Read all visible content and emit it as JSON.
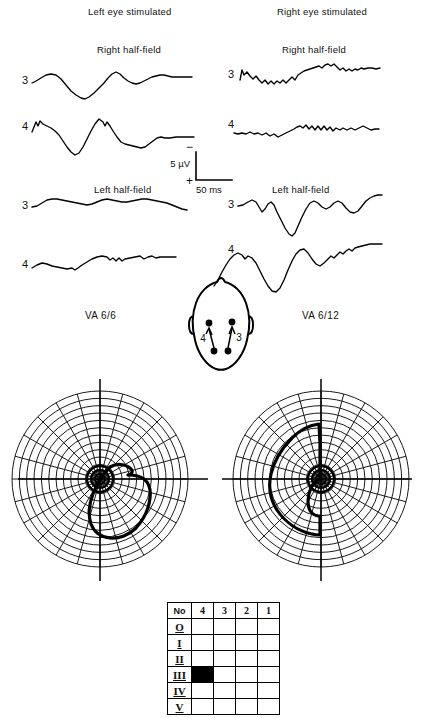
{
  "figure": {
    "type": "half-field-VEP-and-visual-fields",
    "columns": [
      {
        "id": "left-eye",
        "title": "Left eye stimulated",
        "va_label": "VA 6/6"
      },
      {
        "id": "right-eye",
        "title": "Right eye stimulated",
        "va_label": "VA 6/12"
      }
    ],
    "section_titles": {
      "right_half_field": "Right half-field",
      "left_half_field": "Left half-field"
    },
    "channel_labels": {
      "ch3": "3",
      "ch4": "4"
    },
    "scale": {
      "amplitude": "5 µV",
      "time": "50 ms",
      "polarity_top": "−",
      "polarity_bottom": "+"
    },
    "head_diagram": {
      "electrode_labels": [
        "4",
        "3"
      ],
      "electrode_count": 4,
      "view": "top-of-head"
    },
    "legend_table": {
      "header": [
        "No",
        "4",
        "3",
        "2",
        "1"
      ],
      "rows": [
        "O",
        "I",
        "II",
        "III",
        "IV",
        "V"
      ],
      "filled_cell": {
        "row": "III",
        "column": "4"
      }
    }
  },
  "chart_data": [
    {
      "type": "line",
      "id": "left-eye-right-half-field-ch3",
      "title": "Left eye stimulated — Right half-field — channel 3",
      "xlabel": "time (ms)",
      "ylabel": "amplitude (µV)",
      "xlim": [
        0,
        250
      ],
      "ylim": [
        -8,
        8
      ],
      "grid": false,
      "x": [
        0,
        8,
        16,
        24,
        32,
        40,
        48,
        56,
        64,
        72,
        80,
        88,
        96,
        104,
        112,
        120,
        128,
        136,
        144,
        152,
        160,
        168,
        176,
        184,
        192,
        200,
        208,
        216,
        224,
        232,
        240,
        250
      ],
      "values": [
        0.0,
        0.6,
        2.0,
        2.6,
        2.4,
        1.4,
        -0.6,
        -2.6,
        -4.2,
        -4.6,
        -3.4,
        -1.6,
        0.4,
        2.0,
        3.4,
        4.6,
        4.2,
        2.8,
        1.6,
        1.2,
        1.4,
        2.2,
        3.0,
        3.4,
        3.2,
        2.8,
        3.0,
        3.1,
        3.0,
        3.0,
        3.0,
        3.0
      ]
    },
    {
      "type": "line",
      "id": "left-eye-right-half-field-ch4",
      "title": "Left eye stimulated — Right half-field — channel 4",
      "xlabel": "time (ms)",
      "ylabel": "amplitude (µV)",
      "xlim": [
        0,
        250
      ],
      "ylim": [
        -8,
        8
      ],
      "grid": false,
      "x": [
        0,
        8,
        16,
        24,
        32,
        40,
        48,
        56,
        64,
        72,
        80,
        88,
        96,
        104,
        112,
        120,
        128,
        136,
        144,
        152,
        160,
        168,
        176,
        184,
        192,
        200,
        208,
        216,
        224,
        232,
        240,
        250
      ],
      "values": [
        0.0,
        3.0,
        1.6,
        2.6,
        1.6,
        0.8,
        -0.6,
        -2.6,
        -5.0,
        -6.6,
        -5.0,
        -1.6,
        2.2,
        5.4,
        7.2,
        5.4,
        2.6,
        1.4,
        0.6,
        0.2,
        0.6,
        0.2,
        -0.8,
        -1.6,
        -1.2,
        0.6,
        1.6,
        1.2,
        1.6,
        1.8,
        1.8,
        1.8
      ]
    },
    {
      "type": "line",
      "id": "left-eye-left-half-field-ch3",
      "title": "Left eye stimulated — Left half-field — channel 3",
      "xlabel": "time (ms)",
      "ylabel": "amplitude (µV)",
      "xlim": [
        0,
        250
      ],
      "ylim": [
        -8,
        8
      ],
      "grid": false,
      "x": [
        0,
        8,
        16,
        24,
        32,
        40,
        48,
        56,
        64,
        72,
        80,
        88,
        96,
        104,
        112,
        120,
        128,
        136,
        144,
        152,
        160,
        168,
        176,
        184,
        192,
        200,
        208,
        216,
        224,
        232,
        240,
        250
      ],
      "values": [
        0.0,
        0.4,
        1.6,
        1.8,
        1.4,
        1.2,
        1.0,
        0.8,
        0.4,
        0.2,
        0.4,
        1.4,
        1.6,
        1.2,
        1.2,
        1.6,
        1.2,
        0.8,
        1.0,
        1.4,
        1.6,
        1.4,
        1.2,
        1.6,
        1.4,
        1.0,
        0.4,
        -0.2,
        -0.6,
        -1.0,
        -1.2,
        -1.2
      ]
    },
    {
      "type": "line",
      "id": "left-eye-left-half-field-ch4",
      "title": "Left eye stimulated — Left half-field — channel 4",
      "xlabel": "time (ms)",
      "ylabel": "amplitude (µV)",
      "xlim": [
        0,
        250
      ],
      "ylim": [
        -8,
        8
      ],
      "grid": false,
      "x": [
        0,
        8,
        16,
        24,
        32,
        40,
        48,
        56,
        64,
        72,
        80,
        88,
        96,
        104,
        112,
        120,
        128,
        136,
        144,
        152,
        160,
        168,
        176,
        184,
        192,
        200,
        208,
        216,
        224,
        232,
        240,
        250
      ],
      "values": [
        0.0,
        1.0,
        1.4,
        1.2,
        0.6,
        0.4,
        0.2,
        0.0,
        0.8,
        0.4,
        1.2,
        2.0,
        1.8,
        1.4,
        1.6,
        2.0,
        1.4,
        1.8,
        1.2,
        1.8,
        1.2,
        1.6,
        1.4,
        1.6,
        1.4,
        1.6,
        1.5,
        1.5,
        1.5,
        1.5,
        1.5,
        1.5
      ]
    },
    {
      "type": "line",
      "id": "right-eye-right-half-field-ch3",
      "title": "Right eye stimulated — Right half-field — channel 3",
      "xlabel": "time (ms)",
      "ylabel": "amplitude (µV)",
      "xlim": [
        0,
        250
      ],
      "ylim": [
        -8,
        8
      ],
      "grid": false,
      "x": [
        0,
        8,
        16,
        24,
        32,
        40,
        48,
        56,
        64,
        72,
        80,
        88,
        96,
        104,
        112,
        120,
        128,
        136,
        144,
        152,
        160,
        168,
        176,
        184,
        192,
        200,
        208,
        216,
        224,
        232,
        240,
        250
      ],
      "values": [
        0.0,
        2.4,
        1.0,
        1.6,
        0.6,
        1.2,
        0.2,
        0.8,
        0.0,
        0.6,
        -0.2,
        1.2,
        0.4,
        1.6,
        1.0,
        1.8,
        1.4,
        2.2,
        1.6,
        2.4,
        2.0,
        2.6,
        2.0,
        1.6,
        1.8,
        1.4,
        1.8,
        1.6,
        2.0,
        1.8,
        2.0,
        2.0
      ]
    },
    {
      "type": "line",
      "id": "right-eye-right-half-field-ch4",
      "title": "Right eye stimulated — Right half-field — channel 4",
      "xlabel": "time (ms)",
      "ylabel": "amplitude (µV)",
      "xlim": [
        0,
        250
      ],
      "ylim": [
        -8,
        8
      ],
      "grid": false,
      "x": [
        0,
        8,
        16,
        24,
        32,
        40,
        48,
        56,
        64,
        72,
        80,
        88,
        96,
        104,
        112,
        120,
        128,
        136,
        144,
        152,
        160,
        168,
        176,
        184,
        192,
        200,
        208,
        216,
        224,
        232,
        240,
        250
      ],
      "values": [
        0.0,
        0.2,
        0.4,
        0.0,
        0.6,
        0.2,
        -0.4,
        0.2,
        -0.6,
        0.0,
        0.4,
        1.0,
        0.8,
        1.6,
        1.2,
        2.0,
        1.0,
        1.8,
        0.8,
        1.8,
        1.0,
        1.8,
        0.8,
        1.4,
        0.8,
        1.2,
        0.6,
        1.0,
        1.6,
        1.0,
        1.2,
        1.2
      ]
    },
    {
      "type": "line",
      "id": "right-eye-left-half-field-ch3",
      "title": "Right eye stimulated — Left half-field — channel 3",
      "xlabel": "time (ms)",
      "ylabel": "amplitude (µV)",
      "xlim": [
        0,
        250
      ],
      "ylim": [
        -8,
        8
      ],
      "grid": false,
      "x": [
        0,
        8,
        16,
        24,
        32,
        40,
        48,
        56,
        64,
        72,
        80,
        88,
        96,
        104,
        112,
        120,
        128,
        136,
        144,
        152,
        160,
        168,
        176,
        184,
        192,
        200,
        208,
        216,
        224,
        232,
        240,
        250
      ],
      "values": [
        0.0,
        1.6,
        2.0,
        0.6,
        -1.2,
        1.2,
        0.4,
        -2.0,
        -4.6,
        -6.2,
        -4.2,
        -1.0,
        2.0,
        2.8,
        1.6,
        1.0,
        2.2,
        2.4,
        1.0,
        0.0,
        -0.2,
        0.6,
        1.8,
        2.4,
        2.0,
        2.6,
        3.0,
        2.8,
        3.0,
        3.0,
        3.0,
        3.0
      ]
    },
    {
      "type": "line",
      "id": "right-eye-left-half-field-ch4",
      "title": "Right eye stimulated — Left half-field — channel 4",
      "xlabel": "time (ms)",
      "ylabel": "amplitude (µV)",
      "xlim": [
        0,
        250
      ],
      "ylim": [
        -8,
        8
      ],
      "grid": false,
      "x": [
        0,
        8,
        16,
        24,
        32,
        40,
        48,
        56,
        64,
        72,
        80,
        88,
        96,
        104,
        112,
        120,
        128,
        136,
        144,
        152,
        160,
        168,
        176,
        184,
        192,
        200,
        208,
        216,
        224,
        232,
        240,
        250
      ],
      "values": [
        0.0,
        1.4,
        1.0,
        0.6,
        -1.6,
        -4.0,
        -5.6,
        -6.4,
        -5.6,
        -3.0,
        0.6,
        3.4,
        4.6,
        3.2,
        1.8,
        1.4,
        2.6,
        2.8,
        3.0,
        3.4,
        3.2,
        3.6,
        3.8,
        4.0,
        4.2,
        4.2,
        4.3,
        4.3,
        4.3,
        4.3,
        4.3,
        4.3
      ]
    },
    {
      "type": "polar",
      "id": "visual-field-left",
      "title": "Visual field — left (VA 6/6)",
      "grid": true,
      "radial_rings": 12,
      "meridian_step_deg": 15,
      "defect": "small paracentral scotoma extending into lower and temporal quadrants"
    },
    {
      "type": "polar",
      "id": "visual-field-right",
      "title": "Visual field — right (VA 6/12)",
      "grid": true,
      "radial_rings": 12,
      "meridian_step_deg": 15,
      "defect": "large left hemifield scotoma respecting the vertical meridian"
    }
  ]
}
